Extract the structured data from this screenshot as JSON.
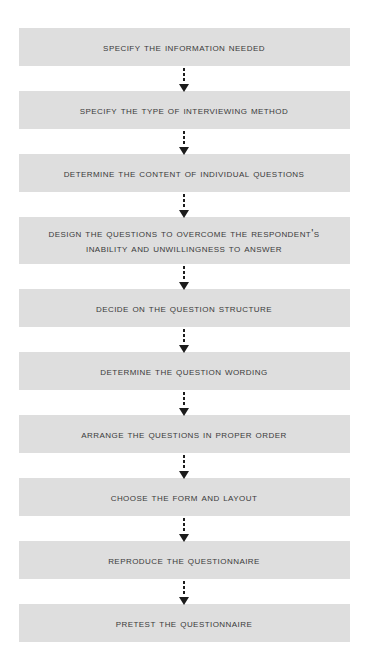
{
  "diagram": {
    "type": "flowchart",
    "orientation": "vertical",
    "box_fill_color": "#dedede",
    "text_color": "#3a3a3a",
    "connector_color": "#1c1c1c",
    "background_color": "#ffffff",
    "connector_style": "dotted-line-with-solid-arrowhead",
    "steps": [
      {
        "number": 1,
        "label": "Specify the Information Needed",
        "lines": 1
      },
      {
        "number": 2,
        "label": "Specify the Type of Interviewing Method",
        "lines": 1
      },
      {
        "number": 3,
        "label": "Determine the Content of Individual Questions",
        "lines": 1
      },
      {
        "number": 4,
        "label": "Design the Questions to Overcome the Respondent's\nInability and Unwillingness to Answer",
        "lines": 2
      },
      {
        "number": 5,
        "label": "Decide on the Question Structure",
        "lines": 1
      },
      {
        "number": 6,
        "label": "Determine the Question Wording",
        "lines": 1
      },
      {
        "number": 7,
        "label": "Arrange the Questions in Proper Order",
        "lines": 1
      },
      {
        "number": 8,
        "label": "Choose the Form and Layout",
        "lines": 1
      },
      {
        "number": 9,
        "label": "Reproduce the Questionnaire",
        "lines": 1
      },
      {
        "number": 10,
        "label": "Pretest the Questionnaire",
        "lines": 1
      }
    ]
  }
}
